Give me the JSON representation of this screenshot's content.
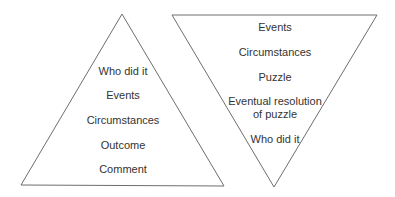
{
  "diagram": {
    "left_triangle": {
      "orientation": "upright",
      "items": [
        "Who did it",
        "Events",
        "Circumstances",
        "Outcome",
        "Comment"
      ]
    },
    "right_triangle": {
      "orientation": "inverted",
      "items": [
        "Events",
        "Circumstances",
        "Puzzle",
        "Eventual resolution",
        "of puzzle",
        "Who did it"
      ]
    },
    "stroke_color": "#6e6e6e",
    "text_color": "#333333"
  }
}
